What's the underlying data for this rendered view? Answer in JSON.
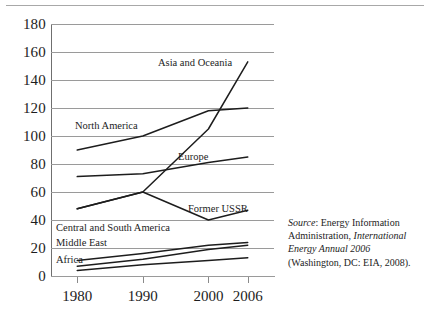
{
  "figure": {
    "top_rule": "decorative-page-rule"
  },
  "chart_data": {
    "type": "line",
    "title": "",
    "subtitle": "",
    "xlabel": "",
    "ylabel": "",
    "x": [
      1980,
      1990,
      2000,
      2006
    ],
    "xtick_labels": [
      "1980",
      "1990",
      "2000",
      "2006"
    ],
    "ytick_labels": [
      "180",
      "160",
      "140",
      "120",
      "100",
      "80",
      "60",
      "40",
      "20",
      "0"
    ],
    "ylim": [
      0,
      180
    ],
    "xlim": [
      1976,
      2010
    ],
    "grid": true,
    "legend_position": "inline-labels",
    "series": [
      {
        "name": "Asia and Oceania",
        "values": [
          48,
          60,
          105,
          153
        ]
      },
      {
        "name": "North America",
        "values": [
          90,
          100,
          118,
          120
        ]
      },
      {
        "name": "Europe",
        "values": [
          71,
          73,
          81,
          85
        ]
      },
      {
        "name": "Former USSR",
        "values": [
          48,
          60,
          40,
          47
        ]
      },
      {
        "name": "Central and South America",
        "values": [
          11,
          16,
          22,
          24
        ]
      },
      {
        "name": "Middle East",
        "values": [
          7,
          12,
          19,
          22
        ]
      },
      {
        "name": "Africa",
        "values": [
          4,
          8,
          11,
          13
        ]
      }
    ],
    "annotations": [
      {
        "label": "Asia and Oceania",
        "x": 158,
        "y": 57
      },
      {
        "label": "North America",
        "x": 75,
        "y": 120
      },
      {
        "label": "Europe",
        "x": 178,
        "y": 151
      },
      {
        "label": "Former USSR",
        "x": 188,
        "y": 203
      },
      {
        "label": "Central and South America",
        "x": 56,
        "y": 222
      },
      {
        "label": "Middle East",
        "x": 56,
        "y": 237
      },
      {
        "label": "Africa",
        "x": 56,
        "y": 254
      }
    ]
  },
  "source_note": {
    "lead": "Source",
    "lead_suffix": ": Energy Information Administration, ",
    "publication": "International Energy Annual 2006",
    "tail": " (Washington, DC: EIA, 2008)."
  },
  "colors": {
    "line": "#1d1d1d",
    "grid": "#9a9a9a",
    "axis": "#6f6f6f",
    "text": "#1d1d1d",
    "background": "#ffffff"
  }
}
